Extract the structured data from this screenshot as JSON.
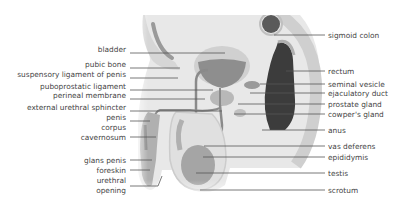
{
  "colors": {
    "tissue_light": "#e6e6e6",
    "tissue_mid": "#c8c8c8",
    "tissue_dark": "#8a8a8a",
    "rectum_dark": "#3a3a3a",
    "leader_line": "#555555",
    "label_text": "#444444"
  },
  "labels_left": [
    {
      "text": "bladder",
      "x_right": 128,
      "y": 49
    },
    {
      "text": "pubic bone",
      "x_right": 128,
      "y": 64
    },
    {
      "text": "suspensory ligament of penis",
      "x_right": 128,
      "y": 74
    },
    {
      "text": "puboprostatic ligament",
      "x_right": 128,
      "y": 86
    },
    {
      "text": "perineal membrane",
      "x_right": 128,
      "y": 95
    },
    {
      "text": "external urethral sphincter",
      "x_right": 128,
      "y": 107
    },
    {
      "text": "penis",
      "x_right": 128,
      "y": 117
    },
    {
      "text": "corpus",
      "x_right": 128,
      "y": 127
    },
    {
      "text": "cavernosum",
      "x_right": 128,
      "y": 137
    },
    {
      "text": "glans penis",
      "x_right": 128,
      "y": 156
    },
    {
      "text": "foreskin",
      "x_right": 128,
      "y": 166
    },
    {
      "text": "urethral",
      "x_right": 128,
      "y": 176
    },
    {
      "text": "opening",
      "x_right": 128,
      "y": 186
    }
  ],
  "labels_right": [
    {
      "text": "sigmoid colon",
      "x": 328,
      "y": 31
    },
    {
      "text": "rectum",
      "x": 328,
      "y": 67
    },
    {
      "text": "seminal vesicle",
      "x": 328,
      "y": 81
    },
    {
      "text": "ejaculatory duct",
      "x": 328,
      "y": 90
    },
    {
      "text": "prostate gland",
      "x": 328,
      "y": 101
    },
    {
      "text": "cowper's gland",
      "x": 328,
      "y": 111
    },
    {
      "text": "anus",
      "x": 328,
      "y": 126
    },
    {
      "text": "vas deferens",
      "x": 328,
      "y": 142
    },
    {
      "text": "epididymis",
      "x": 328,
      "y": 153
    },
    {
      "text": "testis",
      "x": 328,
      "y": 169
    },
    {
      "text": "scrotum",
      "x": 328,
      "y": 186
    }
  ]
}
